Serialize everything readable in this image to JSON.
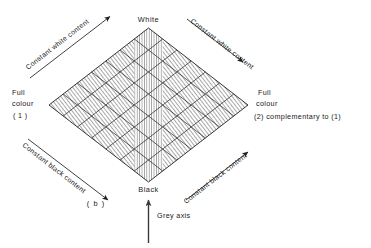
{
  "figure": {
    "caption": "( b )",
    "type": "colour-triangle-rhombus-diagram",
    "vertices": {
      "top": "White",
      "bottom": "Black",
      "left_line1": "Full",
      "left_line2": "colour",
      "left_line3": "( 1 )",
      "right_line1": "Full",
      "right_line2": "colour",
      "right_line3": "(2) complementary  to  (1)"
    },
    "edge_labels": {
      "top_left": "Constant white content",
      "top_right": "Constant white content",
      "bottom_left": "Constant black content",
      "bottom_right": "Constant black content"
    },
    "axis_label": "Grey axis",
    "grid": {
      "rows": 7,
      "columns": 7
    },
    "colors": {
      "ink": "#1f1f1f",
      "grid": "#2b2b2b",
      "hatch": "#555555",
      "paper": "#ffffff"
    }
  }
}
